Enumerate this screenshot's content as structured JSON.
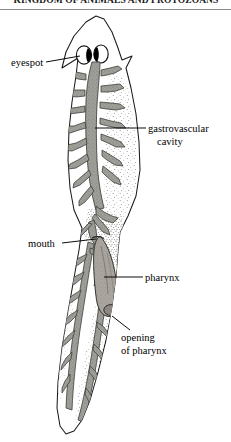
{
  "page": {
    "running_header": "KINGDOM OF ANIMALS AND PROTOZOANS",
    "width": 231,
    "height": 442,
    "background": "#ffffff"
  },
  "figure": {
    "organism": "planarian",
    "view": "dorsal whole-mount, anterior at top",
    "ink_color": "#000000",
    "tissue_fill": "#ffffff",
    "gut_fill": "#9b9b96",
    "stipple_color": "#7d7d78",
    "eyespot_color": "#000000",
    "pharynx_fill": "#a8a29c"
  },
  "labels": [
    {
      "id": "eyespot",
      "text": "eyespot",
      "lines": [
        "eyespot"
      ],
      "side": "left",
      "leader": "horizontal-line"
    },
    {
      "id": "gastrovascular-cavity",
      "text": "gastrovascular cavity",
      "lines": [
        "gastrovascular",
        "cavity"
      ],
      "side": "right",
      "leader": "horizontal-line"
    },
    {
      "id": "mouth",
      "text": "mouth",
      "lines": [
        "mouth"
      ],
      "side": "left",
      "leader": "horizontal-line"
    },
    {
      "id": "pharynx",
      "text": "pharynx",
      "lines": [
        "pharynx"
      ],
      "side": "right",
      "leader": "horizontal-line"
    },
    {
      "id": "opening-of-pharynx",
      "text": "opening of pharynx",
      "lines": [
        "opening",
        "of pharynx"
      ],
      "side": "right",
      "leader": "vertical-line"
    }
  ]
}
